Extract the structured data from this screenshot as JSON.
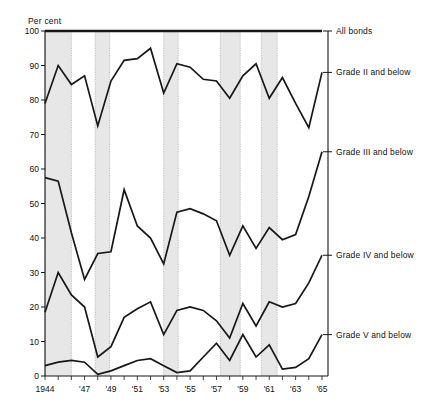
{
  "figure": {
    "y_axis_unit_label": "Per cent",
    "background_color": "#ffffff",
    "line_color": "#171717",
    "recession_band_color": "#d9d9d9"
  },
  "chart_data": {
    "type": "line",
    "title": "",
    "subtitle": "",
    "xlabel": "",
    "ylabel": "Per cent",
    "ylim": [
      0,
      100
    ],
    "xlim": [
      1944,
      1965
    ],
    "grid": false,
    "legend_position": "right-inline",
    "y_ticks": [
      0,
      10,
      20,
      30,
      40,
      50,
      60,
      70,
      80,
      90,
      100
    ],
    "y_tick_labels": [
      "0",
      "10",
      "20",
      "30",
      "40",
      "50",
      "60",
      "70",
      "80",
      "90",
      "100"
    ],
    "x_ticks": [
      1944,
      1945,
      1946,
      1947,
      1948,
      1949,
      1950,
      1951,
      1952,
      1953,
      1954,
      1955,
      1956,
      1957,
      1958,
      1959,
      1960,
      1961,
      1962,
      1963,
      1964,
      1965
    ],
    "x_tick_labels_shown": [
      {
        "x": 1944,
        "label": "1944"
      },
      {
        "x": 1947,
        "label": "'47"
      },
      {
        "x": 1949,
        "label": "'49"
      },
      {
        "x": 1951,
        "label": "'51"
      },
      {
        "x": 1953,
        "label": "'53"
      },
      {
        "x": 1955,
        "label": "'55"
      },
      {
        "x": 1957,
        "label": "'57"
      },
      {
        "x": 1959,
        "label": "'59"
      },
      {
        "x": 1961,
        "label": "'61"
      },
      {
        "x": 1963,
        "label": "'63"
      },
      {
        "x": 1965,
        "label": "'65"
      }
    ],
    "x": [
      1944,
      1945,
      1946,
      1947,
      1948,
      1949,
      1950,
      1951,
      1952,
      1953,
      1954,
      1955,
      1956,
      1957,
      1958,
      1959,
      1960,
      1961,
      1962,
      1963,
      1964,
      1965
    ],
    "series": [
      {
        "name": "All bonds",
        "label": "All bonds",
        "values": [
          100,
          100,
          100,
          100,
          100,
          100,
          100,
          100,
          100,
          100,
          100,
          100,
          100,
          100,
          100,
          100,
          100,
          100,
          100,
          100,
          100,
          100
        ]
      },
      {
        "name": "Grade II and below",
        "label": "Grade II and below",
        "values": [
          79,
          90,
          84.5,
          87,
          72.5,
          85.5,
          91.5,
          92,
          95,
          82,
          90.5,
          89.5,
          86,
          85.5,
          80.5,
          87,
          90.5,
          80.5,
          86.5,
          79,
          72,
          88
        ]
      },
      {
        "name": "Grade III and below",
        "label": "Grade III and below",
        "values": [
          57.5,
          56.5,
          41.5,
          28,
          35.5,
          36,
          54,
          43.5,
          40,
          32.5,
          47.5,
          48.5,
          47,
          45,
          35,
          43.5,
          37,
          43,
          39.5,
          41,
          52,
          65
        ]
      },
      {
        "name": "Grade IV and below",
        "label": "Grade IV and below",
        "values": [
          18.5,
          30,
          23.5,
          20,
          5.5,
          8.5,
          17,
          19.5,
          21.5,
          12,
          19,
          20,
          19,
          16,
          11,
          21,
          14.5,
          21.5,
          20,
          21,
          27,
          35
        ]
      },
      {
        "name": "Grade V and below",
        "label": "Grade V and below",
        "values": [
          3,
          4,
          4.5,
          4,
          0.5,
          1.5,
          3,
          4.5,
          5,
          3,
          1,
          1.5,
          5.5,
          9.5,
          4.5,
          12,
          5.5,
          9,
          2,
          2.5,
          5,
          12
        ]
      }
    ],
    "recession_bands": [
      {
        "start": 1944.0,
        "end": 1946.0
      },
      {
        "start": 1947.8,
        "end": 1948.9
      },
      {
        "start": 1953.0,
        "end": 1954.1
      },
      {
        "start": 1957.3,
        "end": 1958.8
      },
      {
        "start": 1960.4,
        "end": 1961.6
      }
    ]
  }
}
